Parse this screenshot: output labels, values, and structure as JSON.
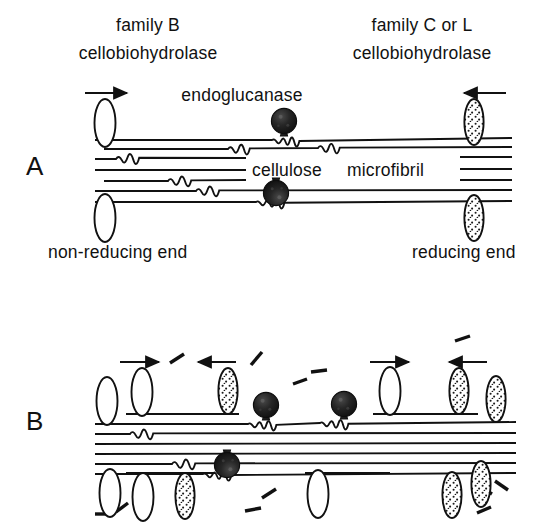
{
  "figure": {
    "title_text": "",
    "panels": [
      {
        "id": "A",
        "letter": "A",
        "left_label_line1": "family  B",
        "left_label_line2": "cellobiohydrolase",
        "right_label_line1": "family  C or L",
        "right_label_line2": "cellobiohydrolase",
        "enzyme_label": "endoglucanase",
        "substrate_label_part1": "cellulose",
        "substrate_label_part2": "microfibril",
        "left_end_label": "non-reducing  end",
        "right_end_label": "reducing  end",
        "left_arrow_direction": "right",
        "right_arrow_direction": "left"
      },
      {
        "id": "B",
        "letter": "B",
        "arrow_directions": [
          "right",
          "left",
          "right",
          "left"
        ]
      }
    ],
    "legend_semantics": {
      "open_ellipse": "family B cellobiohydrolase",
      "stippled_ellipse": "family C or L cellobiohydrolase",
      "filled_circle": "endoglucanase",
      "short_dash": "released cello-oligosaccharide fragment",
      "horizontal_line": "cellulose chain"
    },
    "colors": {
      "ink": "#111111",
      "background": "#ffffff",
      "enzyme_fill": "#1b1b1b",
      "stipple_fill": "#ffffff",
      "stipple_dot": "#1b1b1b"
    },
    "counts": {
      "panel_a_chains": 7,
      "panel_a_open_ellipses": 2,
      "panel_a_stippled_ellipses": 2,
      "panel_a_endoglucanases": 2,
      "panel_b_open_ellipses": 6,
      "panel_b_stippled_ellipses": 7,
      "panel_b_endoglucanases": 3,
      "panel_b_fragments": 11
    }
  }
}
